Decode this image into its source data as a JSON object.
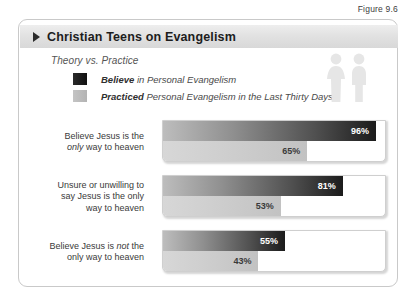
{
  "figure_caption": "Figure 9.6",
  "header": {
    "title": "Christian Teens on Evangelism",
    "arrow_icon": "triangle-right-icon"
  },
  "legend": {
    "subtitle": "Theory vs. Practice",
    "items": [
      {
        "swatch": "dark-swatch",
        "emphasis": "Believe",
        "text": " in Personal Evangelism"
      },
      {
        "swatch": "light-swatch",
        "emphasis": "Practiced",
        "text": " Personal Evangelism in the Last Thirty Days"
      }
    ],
    "people_icon": "two-people-icon"
  },
  "chart_data": {
    "type": "bar",
    "title": "Christian Teens on Evangelism",
    "subtitle": "Theory vs. Practice",
    "orientation": "horizontal",
    "xlabel": "",
    "ylabel": "",
    "xlim": [
      0,
      100
    ],
    "grid": false,
    "legend_position": "top-left",
    "categories": [
      "Believe Jesus is the only way to heaven",
      "Unsure or unwilling to say Jesus is the only way to heaven",
      "Believe Jesus is not the only way to heaven"
    ],
    "series": [
      {
        "name": "Believe in Personal Evangelism",
        "values": [
          96,
          81,
          55
        ],
        "color": "#1b1b1b"
      },
      {
        "name": "Practiced Personal Evangelism in the Last Thirty Days",
        "values": [
          65,
          53,
          43
        ],
        "color": "#c2c2c2"
      }
    ],
    "groups": [
      {
        "label_lines": [
          [
            {
              "t": "Believe Jesus is the",
              "i": false
            }
          ],
          [
            {
              "t": "only ",
              "i": true
            },
            {
              "t": "way to heaven",
              "i": false
            }
          ]
        ],
        "believe": {
          "value": 96,
          "label": "96%"
        },
        "practiced": {
          "value": 65,
          "label": "65%"
        }
      },
      {
        "label_lines": [
          [
            {
              "t": "Unsure or unwilling to",
              "i": false
            }
          ],
          [
            {
              "t": "say Jesus is the only",
              "i": false
            }
          ],
          [
            {
              "t": "way to heaven",
              "i": false
            }
          ]
        ],
        "believe": {
          "value": 81,
          "label": "81%"
        },
        "practiced": {
          "value": 53,
          "label": "53%"
        }
      },
      {
        "label_lines": [
          [
            {
              "t": "Believe Jesus is ",
              "i": false
            },
            {
              "t": "not",
              "i": true
            },
            {
              "t": " the",
              "i": false
            }
          ],
          [
            {
              "t": "only way to heaven",
              "i": false
            }
          ]
        ],
        "believe": {
          "value": 55,
          "label": "55%"
        },
        "practiced": {
          "value": 43,
          "label": "43%"
        }
      }
    ]
  }
}
